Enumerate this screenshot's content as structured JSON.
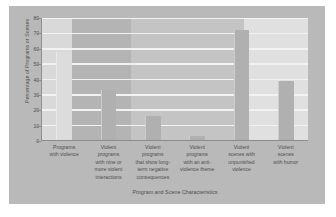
{
  "chart_data": {
    "type": "bar",
    "title": "",
    "xlabel": "Program and Scene Characteristics",
    "ylabel": "Percentage of Programs or Scenes",
    "categories": [
      "Programs with violence",
      "Violent programs with nine or more violent interactions",
      "Violent programs that show long-term negative consequences",
      "Violent programs with an anti-violence theme",
      "Violent scenes with unpunished violence",
      "Violent scenes with humor"
    ],
    "category_lines": [
      [
        "Programs",
        "with violence"
      ],
      [
        "Violent",
        "programs",
        "with nine or",
        "more violent",
        "interactions"
      ],
      [
        "Violent",
        "programs",
        "that show long-",
        "term negative",
        "consequences"
      ],
      [
        "Violent",
        "programs",
        "with an anti-",
        "violence theme"
      ],
      [
        "Violent",
        "scenes with",
        "unpunished",
        "violence"
      ],
      [
        "Violent",
        "scenes",
        "with humor"
      ]
    ],
    "values": [
      58,
      33,
      16,
      3,
      72,
      39
    ],
    "ylim": [
      0,
      80
    ],
    "yticks": [
      0,
      10,
      20,
      30,
      40,
      50,
      60,
      70,
      80
    ],
    "ytick_labels": [
      "0",
      "10",
      "20",
      "30",
      "40",
      "50",
      "60",
      "70",
      "80"
    ],
    "grid": "horizontal",
    "legend": "none",
    "colors": {
      "figure_background": "#b9b9b9",
      "plot_background": "#c9c9c9",
      "gridline": "#f2f2f2",
      "bar_fill": "#b0b0b0",
      "bar_fill_light": "#dcdcdc",
      "axis": "#8d8d8d",
      "text": "#4e4e4e"
    },
    "background_bands": [
      {
        "left_pct": 0,
        "width_pct": 11.3,
        "color": "#d9d9d9"
      },
      {
        "left_pct": 11.3,
        "width_pct": 22.2,
        "color": "#b4b4b4"
      },
      {
        "left_pct": 33.5,
        "width_pct": 42.5,
        "color": "#c4c4c4"
      },
      {
        "left_pct": 76.0,
        "width_pct": 24.0,
        "color": "#e0e0e0"
      }
    ]
  }
}
